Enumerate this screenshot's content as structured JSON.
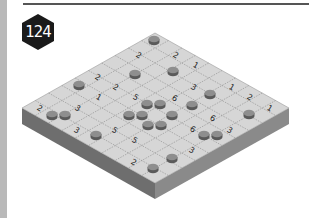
{
  "puzzle": {
    "number_label": "124",
    "grid_size": 10
  },
  "colors": {
    "badge": "#1a1a1a",
    "board_top": "#d6d6d6",
    "board_left_side": "#6e6e6e",
    "board_right_side": "#8a8a8a",
    "grid_line": "#8c8c8c",
    "token": "#7a7a7a",
    "token_top": "#8e8e8e",
    "token_side": "#5a5a5a",
    "text": "#222222"
  },
  "board": {
    "corners": {
      "top": [
        155,
        33
      ],
      "left": [
        22,
        108
      ],
      "right": [
        289,
        108
      ],
      "bottom": [
        155,
        183
      ]
    },
    "depth": 16
  },
  "numbers": [
    {
      "label": "2",
      "x": 139,
      "y": 55
    },
    {
      "label": "2",
      "x": 176,
      "y": 55
    },
    {
      "label": "1",
      "x": 196,
      "y": 65
    },
    {
      "label": "2",
      "x": 98,
      "y": 77
    },
    {
      "label": "2",
      "x": 116,
      "y": 87
    },
    {
      "label": "3",
      "x": 194,
      "y": 87
    },
    {
      "label": "1",
      "x": 232,
      "y": 87
    },
    {
      "label": "1",
      "x": 99,
      "y": 97
    },
    {
      "label": "5",
      "x": 136,
      "y": 97
    },
    {
      "label": "6",
      "x": 175,
      "y": 98
    },
    {
      "label": "2",
      "x": 250,
      "y": 97
    },
    {
      "label": "2",
      "x": 40,
      "y": 108
    },
    {
      "label": "3",
      "x": 78,
      "y": 108
    },
    {
      "label": "1",
      "x": 270,
      "y": 108
    },
    {
      "label": "6",
      "x": 213,
      "y": 118
    },
    {
      "label": "3",
      "x": 77,
      "y": 130
    },
    {
      "label": "5",
      "x": 115,
      "y": 130
    },
    {
      "label": "6",
      "x": 193,
      "y": 129
    },
    {
      "label": "3",
      "x": 230,
      "y": 130
    },
    {
      "label": "5",
      "x": 135,
      "y": 140
    },
    {
      "label": "3",
      "x": 192,
      "y": 150
    },
    {
      "label": "2",
      "x": 134,
      "y": 162
    }
  ],
  "tokens": [
    {
      "x": 154,
      "y": 42
    },
    {
      "x": 135,
      "y": 76
    },
    {
      "x": 173,
      "y": 73
    },
    {
      "x": 79,
      "y": 87
    },
    {
      "x": 210,
      "y": 96
    },
    {
      "x": 147,
      "y": 106
    },
    {
      "x": 160,
      "y": 106
    },
    {
      "x": 192,
      "y": 107
    },
    {
      "x": 52,
      "y": 117
    },
    {
      "x": 65,
      "y": 117
    },
    {
      "x": 129,
      "y": 117
    },
    {
      "x": 142,
      "y": 117
    },
    {
      "x": 172,
      "y": 117
    },
    {
      "x": 249,
      "y": 116
    },
    {
      "x": 148,
      "y": 127
    },
    {
      "x": 161,
      "y": 127
    },
    {
      "x": 96,
      "y": 137
    },
    {
      "x": 204,
      "y": 137
    },
    {
      "x": 217,
      "y": 137
    },
    {
      "x": 172,
      "y": 160
    },
    {
      "x": 153,
      "y": 170
    }
  ]
}
